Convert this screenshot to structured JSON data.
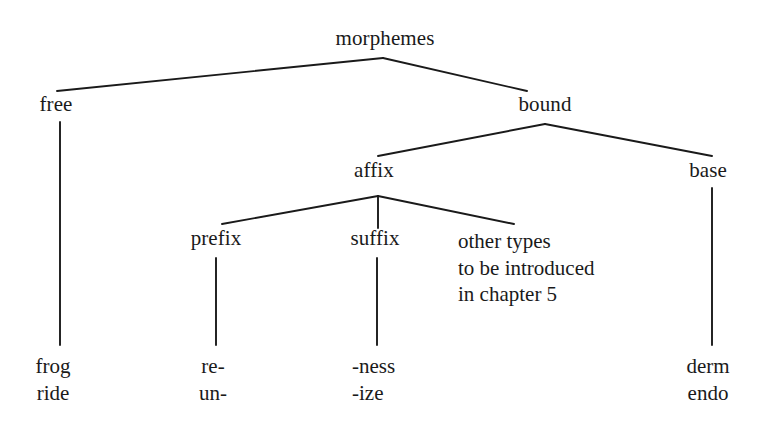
{
  "diagram": {
    "title": "morphemes",
    "type": "tree-diagram",
    "line_color": "#1a1a1a",
    "text_color": "#1a1a1a",
    "background_color": "#ffffff",
    "nodes": {
      "root": {
        "label": "morphemes",
        "x": 385,
        "y": 44
      },
      "free": {
        "label": "free",
        "x": 56,
        "y": 110
      },
      "bound": {
        "label": "bound",
        "x": 545,
        "y": 110
      },
      "affix": {
        "label": "affix",
        "x": 374,
        "y": 176
      },
      "base": {
        "label": "base",
        "x": 708,
        "y": 176
      },
      "prefix": {
        "label": "prefix",
        "x": 216,
        "y": 243
      },
      "suffix": {
        "label": "suffix",
        "x": 375,
        "y": 243
      },
      "other_types": {
        "lines": [
          "other types",
          "to be introduced",
          "in chapter 5"
        ],
        "x": 458,
        "y": 243
      }
    },
    "leaves": {
      "free_examples": {
        "lines": [
          "frog",
          "ride"
        ],
        "x": 53,
        "y": 367
      },
      "prefix_examples": {
        "lines": [
          "re-",
          "un-"
        ],
        "x": 213,
        "y": 367
      },
      "suffix_examples": {
        "lines": [
          "-ness",
          "-ize"
        ],
        "x": 352,
        "y": 367
      },
      "base_examples": {
        "lines": [
          "derm",
          "endo"
        ],
        "x": 708,
        "y": 367
      }
    },
    "edges": [
      {
        "name": "morphemes-to-free",
        "x1": 383,
        "y1": 58,
        "x2": 57,
        "y2": 91
      },
      {
        "name": "morphemes-to-bound",
        "x1": 383,
        "y1": 58,
        "x2": 527,
        "y2": 91
      },
      {
        "name": "free-to-examples",
        "x1": 60,
        "y1": 122,
        "x2": 60,
        "y2": 345
      },
      {
        "name": "bound-to-affix",
        "x1": 545,
        "y1": 124,
        "x2": 378,
        "y2": 156
      },
      {
        "name": "bound-to-base",
        "x1": 545,
        "y1": 124,
        "x2": 712,
        "y2": 156
      },
      {
        "name": "affix-to-prefix",
        "x1": 378,
        "y1": 196,
        "x2": 222,
        "y2": 224
      },
      {
        "name": "affix-to-suffix",
        "x1": 378,
        "y1": 196,
        "x2": 378,
        "y2": 228
      },
      {
        "name": "affix-to-other-types",
        "x1": 378,
        "y1": 196,
        "x2": 514,
        "y2": 224
      },
      {
        "name": "prefix-to-examples",
        "x1": 216,
        "y1": 258,
        "x2": 216,
        "y2": 345
      },
      {
        "name": "suffix-to-examples",
        "x1": 377,
        "y1": 258,
        "x2": 377,
        "y2": 345
      },
      {
        "name": "base-to-examples",
        "x1": 712,
        "y1": 188,
        "x2": 712,
        "y2": 345
      }
    ]
  }
}
